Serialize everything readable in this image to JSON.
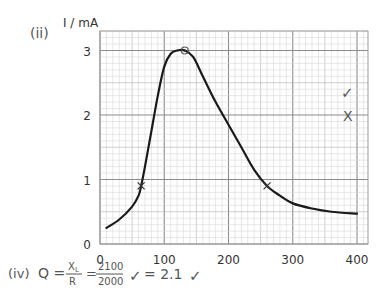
{
  "part_label": "(ii)",
  "y_axis_label": "I / mA",
  "formula": {
    "part": "(iv)",
    "lhs": "Q =",
    "frac1_num": "X",
    "frac1_num_sub": "L",
    "frac1_den": "R",
    "eq": "=",
    "frac2_num": "2100",
    "frac2_den": "2000",
    "tick1": "✓",
    "result": "= 2.1",
    "tick2": "✓"
  },
  "margin_marks": {
    "tick": "✓",
    "cross": "X"
  },
  "colors": {
    "curve": "#1a1a1a",
    "grid_minor": "#d6d6d6",
    "grid_major": "#8c8c8c",
    "text": "#333333"
  },
  "chart_data": {
    "type": "line",
    "title": "",
    "xlabel": "",
    "ylabel": "I / mA",
    "xlim": [
      0,
      420
    ],
    "ylim": [
      0,
      3.3
    ],
    "x_ticks": [
      0,
      100,
      200,
      300,
      400
    ],
    "y_ticks": [
      0,
      1,
      2,
      3
    ],
    "grid": true,
    "series": [
      {
        "name": "resonance curve",
        "x": [
          10,
          30,
          50,
          60,
          64,
          70,
          80,
          90,
          100,
          110,
          120,
          132,
          145,
          160,
          180,
          200,
          220,
          240,
          260,
          280,
          300,
          330,
          360,
          400
        ],
        "y": [
          0.25,
          0.38,
          0.58,
          0.75,
          0.9,
          1.2,
          1.75,
          2.3,
          2.75,
          2.95,
          3.0,
          3.0,
          2.9,
          2.6,
          2.2,
          1.85,
          1.5,
          1.15,
          0.9,
          0.75,
          0.63,
          0.55,
          0.5,
          0.47
        ]
      }
    ],
    "annotations": [
      {
        "type": "cross",
        "x": 64,
        "y": 0.9
      },
      {
        "type": "cross",
        "x": 260,
        "y": 0.9
      },
      {
        "type": "circle",
        "x": 132,
        "y": 3.0
      }
    ]
  }
}
